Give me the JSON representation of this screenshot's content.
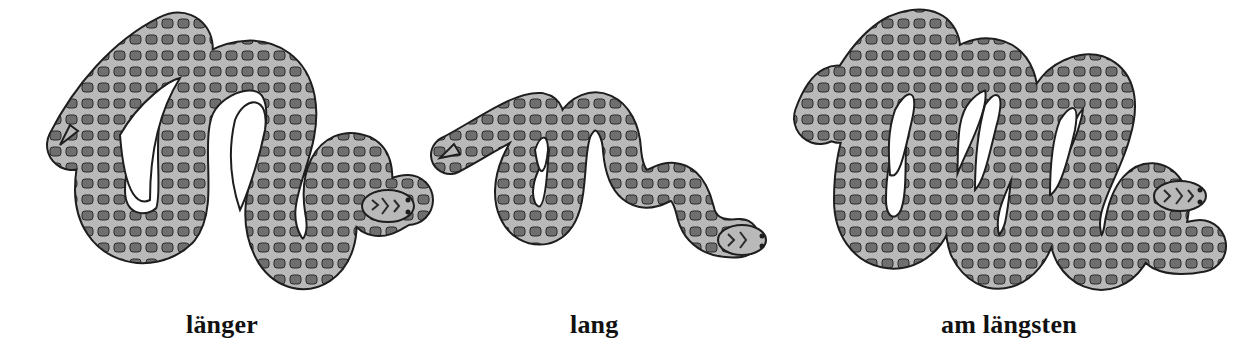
{
  "worksheet": {
    "items": [
      {
        "label": "länger",
        "icon": "snake-medium-icon"
      },
      {
        "label": "lang",
        "icon": "snake-short-icon"
      },
      {
        "label": "am längsten",
        "icon": "snake-long-icon"
      }
    ]
  },
  "colors": {
    "background": "#ffffff",
    "snake_body": "#b9b9b9",
    "snake_blotch": "#6f6f6f",
    "outline": "#1e1e1e",
    "label_text": "#111111"
  }
}
